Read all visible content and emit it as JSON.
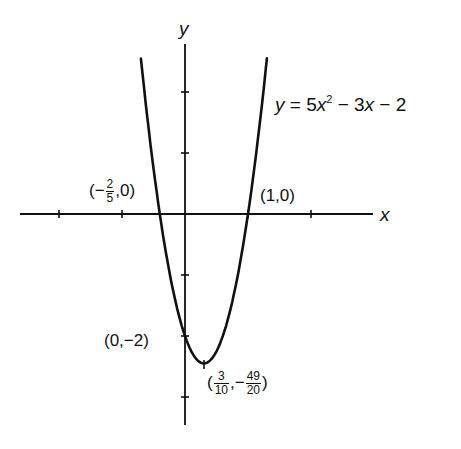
{
  "figure": {
    "equation": {
      "lhs": "y",
      "eq": " = 5",
      "var1": "x",
      "exp": "2",
      "mid": " − 3",
      "var2": "x",
      "tail": " − 2"
    },
    "axis_labels": {
      "x": "x",
      "y": "y"
    },
    "points": {
      "root_left": {
        "open": "(−",
        "num": "2",
        "den": "5",
        "close": ",0)"
      },
      "root_right": {
        "text": "(1,0)"
      },
      "y_intercept": {
        "text": "(0,−2)"
      },
      "vertex": {
        "open": "(",
        "num1": "3",
        "den1": "10",
        "sep": ",−",
        "num2": "49",
        "den2": "20",
        "close": ")"
      }
    },
    "colors": {
      "ink": "#111111",
      "background": "#ffffff"
    }
  },
  "chart_data": {
    "type": "line",
    "xlabel": "x",
    "ylabel": "y",
    "function": "5x^2 - 3x - 2",
    "xlim": [
      -2.6,
      3.0
    ],
    "ylim": [
      -3.4,
      2.8
    ],
    "x_ticks": [
      -2,
      -1,
      1,
      2
    ],
    "y_ticks": [
      -3,
      -2,
      -1,
      1,
      2
    ],
    "grid": false,
    "annotated_points": [
      {
        "label": "(-2/5, 0)",
        "x": -0.4,
        "y": 0
      },
      {
        "label": "(1, 0)",
        "x": 1,
        "y": 0
      },
      {
        "label": "(0, -2)",
        "x": 0,
        "y": -2
      },
      {
        "label": "(3/10, -49/20)",
        "x": 0.3,
        "y": -2.45
      }
    ],
    "curve_x_range": [
      -0.7,
      1.3
    ]
  }
}
